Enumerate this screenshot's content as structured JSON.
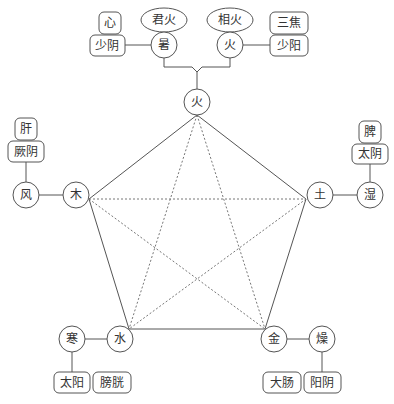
{
  "diagram": {
    "title": "",
    "elements": {
      "fire": {
        "label": "火"
      },
      "wood": {
        "label": "木"
      },
      "earth": {
        "label": "土"
      },
      "metal": {
        "label": "金"
      },
      "water": {
        "label": "水"
      }
    },
    "qi": {
      "summer_heat": {
        "label": "暑",
        "sub": "君火",
        "channel": "少阴",
        "organ": "心"
      },
      "minister_fire": {
        "label": "火",
        "sub": "相火",
        "channel": "少阳",
        "organ": "三焦"
      },
      "wind": {
        "label": "风",
        "channel": "厥阴",
        "organ": "肝"
      },
      "damp": {
        "label": "湿",
        "channel": "太阴",
        "organ": "脾"
      },
      "cold": {
        "label": "寒",
        "channel": "太阳",
        "organ": "膀胱"
      },
      "dryness": {
        "label": "燥",
        "channel": "阳阴",
        "organ": "大肠"
      }
    },
    "colors": {
      "line": "#555555",
      "text": "#333333",
      "dotted": "#777777"
    }
  }
}
